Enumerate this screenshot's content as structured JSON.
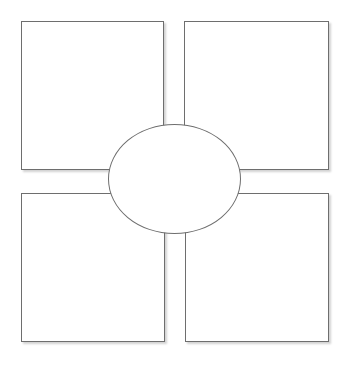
{
  "diagram": {
    "type": "graphic-organizer",
    "colors": {
      "stroke": "#6e6e6e",
      "fill": "#ffffff",
      "background": "#ffffff"
    },
    "center": {
      "shape": "ellipse",
      "label": "",
      "x": 108,
      "y": 124,
      "w": 133,
      "h": 110
    },
    "boxes": [
      {
        "id": "top-left",
        "label": "",
        "x": 21,
        "y": 21,
        "w": 143,
        "h": 149
      },
      {
        "id": "top-right",
        "label": "",
        "x": 184,
        "y": 21,
        "w": 145,
        "h": 149
      },
      {
        "id": "bottom-left",
        "label": "",
        "x": 21,
        "y": 193,
        "w": 144,
        "h": 149
      },
      {
        "id": "bottom-right",
        "label": "",
        "x": 185,
        "y": 193,
        "w": 144,
        "h": 149
      }
    ]
  }
}
